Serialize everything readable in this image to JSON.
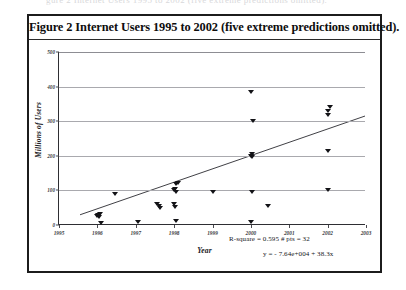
{
  "scan": {
    "partial_line_above": "gure 2 Internet Users 1995 to 2002 (five extreme predictions omitted)."
  },
  "figure": {
    "caption": "Figure 2 Internet Users 1995 to 2002 (five extreme predictions omitted)."
  },
  "stats": {
    "r_square": "R-square = 0.595   # pts = 32",
    "equation": "y = - 7.64e+004 + 38.3x"
  },
  "chart_data": {
    "type": "scatter",
    "title": "Figure 2 Internet Users 1995 to 2002 (five extreme predictions omitted).",
    "xlabel": "Year",
    "ylabel": "Millions of Users",
    "xlim": [
      1995,
      2003
    ],
    "ylim": [
      0,
      500
    ],
    "xticks": [
      "1995",
      "1996",
      "1997",
      "1998",
      "1999",
      "2000",
      "2001",
      "2002",
      "2003"
    ],
    "xtick_values": [
      1995,
      1996,
      1997,
      1998,
      1999,
      2000,
      2001,
      2002,
      2003
    ],
    "yticks": [
      "0",
      "100",
      "200",
      "300",
      "400",
      "500"
    ],
    "ytick_values": [
      0,
      100,
      200,
      300,
      400,
      500
    ],
    "grid": "horizontal",
    "legend": "none",
    "marker": "down-triangle",
    "series": [
      {
        "name": "Internet user predictions",
        "points": [
          [
            1996.0,
            25
          ],
          [
            1996.02,
            30
          ],
          [
            1996.05,
            22
          ],
          [
            1996.08,
            33
          ],
          [
            1996.1,
            5
          ],
          [
            1996.45,
            90
          ],
          [
            1997.55,
            62
          ],
          [
            1997.6,
            55
          ],
          [
            1997.62,
            48
          ],
          [
            1998.0,
            100
          ],
          [
            1998.02,
            104
          ],
          [
            1998.05,
            96
          ],
          [
            1998.06,
            118
          ],
          [
            1998.1,
            122
          ],
          [
            1998.0,
            60
          ],
          [
            1998.02,
            52
          ],
          [
            1998.05,
            12
          ],
          [
            1997.05,
            8
          ],
          [
            1999.0,
            95
          ],
          [
            2000.0,
            200
          ],
          [
            2000.02,
            205
          ],
          [
            2000.04,
            196
          ],
          [
            2000.0,
            385
          ],
          [
            2000.05,
            300
          ],
          [
            2000.02,
            95
          ],
          [
            2000.0,
            10
          ],
          [
            2000.45,
            55
          ],
          [
            2002.0,
            330
          ],
          [
            2002.02,
            318
          ],
          [
            2002.05,
            340
          ],
          [
            2002.0,
            215
          ],
          [
            2002.0,
            100
          ]
        ]
      }
    ],
    "fit_line": {
      "type": "linear",
      "slope": 38.3,
      "intercept": -76400,
      "r_square": 0.595,
      "n_points": 32,
      "x_start": 1995.55,
      "x_end": 2003.0
    }
  }
}
